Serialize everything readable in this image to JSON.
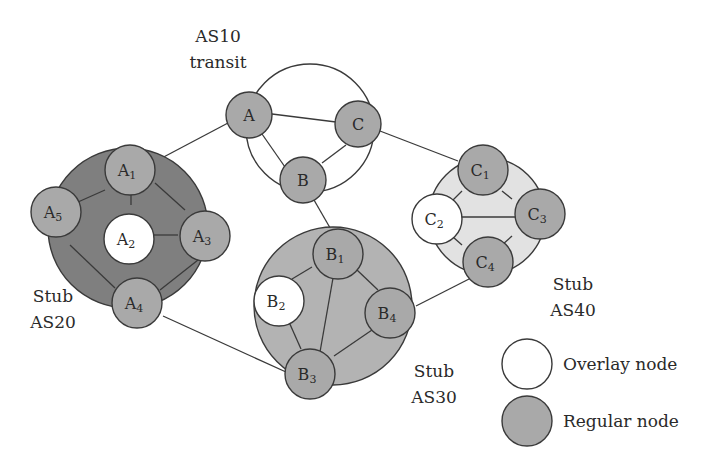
{
  "colors": {
    "regular_node": "#a9a9a9",
    "overlay_node": "#ffffff",
    "as20_region": "#7f7f7f",
    "as30_region": "#b3b3b3",
    "as40_region": "#e2e2e2",
    "as10_region": "#ffffff",
    "stroke": "#3a3a3a"
  },
  "labels": {
    "as10_line1": "AS10",
    "as10_line2": "transit",
    "as20_line1": "Stub",
    "as20_line2": "AS20",
    "as30_line1": "Stub",
    "as30_line2": "AS30",
    "as40_line1": "Stub",
    "as40_line2": "AS40"
  },
  "legend": {
    "overlay": "Overlay node",
    "regular": "Regular node"
  },
  "nodes": {
    "A": {
      "base": "A",
      "sub": ""
    },
    "B": {
      "base": "B",
      "sub": ""
    },
    "C": {
      "base": "C",
      "sub": ""
    },
    "A1": {
      "base": "A",
      "sub": "1"
    },
    "A2": {
      "base": "A",
      "sub": "2"
    },
    "A3": {
      "base": "A",
      "sub": "3"
    },
    "A4": {
      "base": "A",
      "sub": "4"
    },
    "A5": {
      "base": "A",
      "sub": "5"
    },
    "B1": {
      "base": "B",
      "sub": "1"
    },
    "B2": {
      "base": "B",
      "sub": "2"
    },
    "B3": {
      "base": "B",
      "sub": "3"
    },
    "B4": {
      "base": "B",
      "sub": "4"
    },
    "C1": {
      "base": "C",
      "sub": "1"
    },
    "C2": {
      "base": "C",
      "sub": "2"
    },
    "C3": {
      "base": "C",
      "sub": "3"
    },
    "C4": {
      "base": "C",
      "sub": "4"
    }
  }
}
